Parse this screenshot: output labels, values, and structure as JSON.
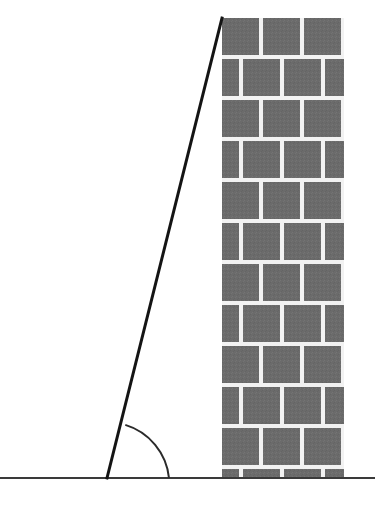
{
  "figure": {
    "kind": "geometry-diagram",
    "canvas": {
      "width": 375,
      "height": 506,
      "background": "#ffffff"
    },
    "colors": {
      "background": "#ffffff",
      "brick_fill": "#6b6b6b",
      "brick_fill_alt": "#707070",
      "mortar": "#f2f2f2",
      "ground_line": "#3a3a3a",
      "ladder_line": "#141414",
      "arc_line": "#2b2b2b"
    }
  },
  "ground": {
    "label": "ground-line",
    "y": 478,
    "x_start": 0,
    "x_end": 375,
    "stroke_width": 2
  },
  "wall": {
    "label": "brick-wall",
    "x": 222,
    "y_top": 18,
    "width": 122,
    "height": 460,
    "row_height": 41,
    "mortar_width": 4,
    "columns_per_row": 3,
    "rows": [
      {
        "type": "full",
        "bricks": [
          1,
          1,
          1
        ]
      },
      {
        "type": "offset",
        "bricks": [
          0.5,
          1,
          1,
          0.5
        ]
      },
      {
        "type": "full",
        "bricks": [
          1,
          1,
          1
        ]
      },
      {
        "type": "offset",
        "bricks": [
          0.5,
          1,
          1,
          0.5
        ]
      },
      {
        "type": "full",
        "bricks": [
          1,
          1,
          1
        ]
      },
      {
        "type": "offset",
        "bricks": [
          0.5,
          1,
          1,
          0.5
        ]
      },
      {
        "type": "full",
        "bricks": [
          1,
          1,
          1
        ]
      },
      {
        "type": "offset",
        "bricks": [
          0.5,
          1,
          1,
          0.5
        ]
      },
      {
        "type": "full",
        "bricks": [
          1,
          1,
          1
        ]
      },
      {
        "type": "offset",
        "bricks": [
          0.5,
          1,
          1,
          0.5
        ]
      },
      {
        "type": "full",
        "bricks": [
          1,
          1,
          1
        ]
      },
      {
        "type": "offset",
        "bricks": [
          0.5,
          1,
          1,
          0.5
        ]
      }
    ]
  },
  "ladder": {
    "label": "ladder-line",
    "base_x": 107,
    "base_y": 478,
    "top_x": 222,
    "top_y": 18,
    "stroke_width": 3
  },
  "angle": {
    "label": "angle-arc",
    "vertex_x": 107,
    "vertex_y": 478,
    "radius": 62,
    "stroke_width": 2,
    "arc_start_x": 125,
    "arc_start_y": 425,
    "arc_end_x": 169,
    "arc_end_y": 478
  }
}
